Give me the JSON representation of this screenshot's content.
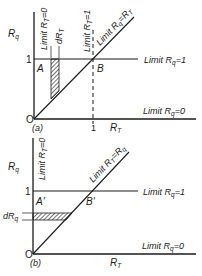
{
  "panel_a": {
    "tag": "(a)",
    "y_axis_label": {
      "main": "R",
      "sub": "q"
    },
    "x_axis_label": {
      "main": "R",
      "sub": "T"
    },
    "origin_label": "O",
    "y_tick_1": "1",
    "x_tick_1": "1",
    "point_A": "A",
    "point_B": "B",
    "strip_label": {
      "main": "dR",
      "sub": "T"
    },
    "limit_rt0": {
      "pre": "Limit R",
      "sub": "T",
      "post": "=0"
    },
    "limit_rt1": {
      "pre": "Limit R",
      "sub": "T",
      "post": "=1"
    },
    "limit_diag": {
      "pre": "Limit R",
      "sub1": "q",
      "mid": "=R",
      "sub2": "T"
    },
    "limit_rq1": {
      "pre": "Limit R",
      "sub": "q",
      "post": "=1"
    },
    "limit_rq0": {
      "pre": "Limit R",
      "sub": "q",
      "post": "=0"
    }
  },
  "panel_b": {
    "tag": "(b)",
    "y_axis_label": {
      "main": "R",
      "sub": "q"
    },
    "x_axis_label": {
      "main": "R",
      "sub": "T"
    },
    "origin_label": "O",
    "y_tick_1": "1",
    "point_A": "A'",
    "point_B": "B'",
    "strip_label": {
      "main": "dR",
      "sub": "q"
    },
    "limit_rt0": {
      "pre": "Limit R",
      "sub": "T",
      "post": "=0"
    },
    "limit_diag": {
      "pre": "Limit R",
      "sub1": "T",
      "mid": "=R",
      "sub2": "q"
    },
    "limit_rq1": {
      "pre": "Limit R",
      "sub": "q",
      "post": "=1"
    },
    "limit_rq0": {
      "pre": "Limit R",
      "sub": "q",
      "post": "=0"
    }
  },
  "colors": {
    "ink": "#1a1a1a",
    "background": "#ffffff"
  }
}
